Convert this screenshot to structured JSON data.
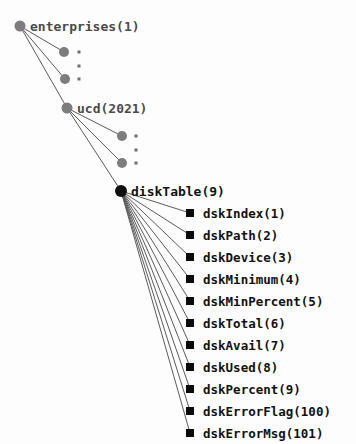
{
  "diagram": {
    "type": "snmp-mib-tree",
    "background_color": "#fdfdfd",
    "node_color": "#7d7d7d",
    "hub_color": "#101010",
    "edge_color": "#5a5a5a",
    "nodes": {
      "enterprises": {
        "label": "enterprises(1)",
        "x": 20,
        "y": 26,
        "r": 5.5,
        "shape": "circle",
        "color": "#7d7d7d",
        "label_x": 30
      },
      "ucd": {
        "label": "ucd(2021)",
        "x": 67,
        "y": 108,
        "r": 5.5,
        "shape": "circle",
        "color": "#7d7d7d",
        "label_x": 77
      },
      "diskTable": {
        "label": "diskTable(9)",
        "x": 121,
        "y": 191,
        "r": 6,
        "shape": "circle",
        "color": "#101010",
        "label_x": 131
      }
    },
    "stub_nodes": [
      {
        "x": 64,
        "y": 52,
        "r": 5,
        "dot_x": 79,
        "dot_y": 52
      },
      {
        "x": 65,
        "y": 79,
        "r": 5,
        "dot_x": 79,
        "dot_y": 79
      },
      {
        "x": 122,
        "y": 136,
        "r": 5,
        "dot_x": 136,
        "dot_y": 136
      },
      {
        "x": 122,
        "y": 163,
        "r": 5,
        "dot_x": 136,
        "dot_y": 163
      }
    ],
    "mid_dots": [
      {
        "x": 79,
        "y": 65.5
      },
      {
        "x": 136,
        "y": 149.5
      }
    ],
    "leaves": [
      {
        "label": "dskIndex(1)",
        "x": 190,
        "y": 213
      },
      {
        "label": "dskPath(2)",
        "x": 190,
        "y": 235
      },
      {
        "label": "dskDevice(3)",
        "x": 190,
        "y": 257
      },
      {
        "label": "dskMinimum(4)",
        "x": 190,
        "y": 279
      },
      {
        "label": "dskMinPercent(5)",
        "x": 190,
        "y": 301
      },
      {
        "label": "dskTotal(6)",
        "x": 190,
        "y": 323
      },
      {
        "label": "dskAvail(7)",
        "x": 190,
        "y": 345
      },
      {
        "label": "dskUsed(8)",
        "x": 190,
        "y": 367
      },
      {
        "label": "dskPercent(9)",
        "x": 190,
        "y": 389
      },
      {
        "label": "dskErrorFlag(100)",
        "x": 190,
        "y": 411
      },
      {
        "label": "dskErrorMsg(101)",
        "x": 190,
        "y": 433
      }
    ],
    "leaf_square_size": 8,
    "leaf_label_offset": 13,
    "edges_from_enterprises": [
      {
        "to_x": 64,
        "to_y": 52
      },
      {
        "to_x": 65,
        "to_y": 79
      },
      {
        "to_x": 67,
        "to_y": 108
      }
    ],
    "edges_from_ucd": [
      {
        "to_x": 122,
        "to_y": 136
      },
      {
        "to_x": 122,
        "to_y": 163
      },
      {
        "to_x": 121,
        "to_y": 191
      }
    ]
  }
}
